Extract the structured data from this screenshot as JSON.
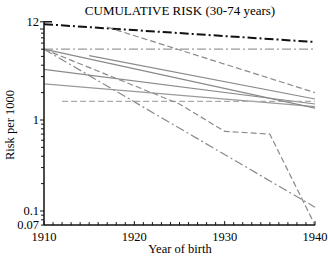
{
  "chart_data": {
    "type": "line",
    "title": "CUMULATIVE RISK (30-74 years)",
    "xlabel": "Year of birth",
    "ylabel": "Risk per 1000",
    "xlim": [
      1910,
      1940
    ],
    "ylim": [
      0.07,
      12
    ],
    "yscale": "log",
    "grid": false,
    "legend": "none",
    "x_ticks": [
      "1910",
      "1920",
      "1930",
      "1940"
    ],
    "y_ticks": [
      "12",
      "1",
      "0.1",
      "0.07"
    ],
    "series": [
      {
        "name": "series-1",
        "style": "dash-dot",
        "color": "#111111",
        "width": 2,
        "x": [
          1910,
          1940
        ],
        "values": [
          11.3,
          7.2
        ]
      },
      {
        "name": "series-2",
        "style": "dash-dot",
        "color": "#9a9a9a",
        "width": 1.2,
        "x": [
          1910,
          1940
        ],
        "values": [
          6.0,
          6.0
        ]
      },
      {
        "name": "series-3",
        "style": "dashed",
        "color": "#8a8a8a",
        "width": 1.2,
        "x": [
          1917,
          1940
        ],
        "values": [
          10.5,
          2.0
        ]
      },
      {
        "name": "series-4",
        "style": "solid",
        "color": "#8a8a8a",
        "width": 1.2,
        "x": [
          1915,
          1940
        ],
        "values": [
          5.1,
          1.7
        ]
      },
      {
        "name": "series-5",
        "style": "solid",
        "color": "#8a8a8a",
        "width": 1.2,
        "x": [
          1910,
          1940
        ],
        "values": [
          3.6,
          1.5
        ]
      },
      {
        "name": "series-6",
        "style": "solid",
        "color": "#9a9a9a",
        "width": 1.2,
        "x": [
          1910,
          1940
        ],
        "values": [
          2.5,
          1.4
        ]
      },
      {
        "name": "series-7",
        "style": "dashed",
        "color": "#aaaaaa",
        "width": 1.2,
        "x": [
          1912,
          1940
        ],
        "values": [
          1.6,
          1.6
        ]
      },
      {
        "name": "series-8",
        "style": "solid",
        "color": "#8a8a8a",
        "width": 1.2,
        "x": [
          1910,
          1940
        ],
        "values": [
          6.0,
          1.35
        ]
      },
      {
        "name": "series-9",
        "style": "dashed",
        "color": "#8a8a8a",
        "width": 1.2,
        "x": [
          1910,
          1925,
          1930,
          1935,
          1940
        ],
        "values": [
          6.0,
          1.5,
          0.75,
          0.7,
          0.07
        ]
      },
      {
        "name": "series-10",
        "style": "dash-dot",
        "color": "#8a8a8a",
        "width": 1.2,
        "x": [
          1910,
          1940
        ],
        "values": [
          6.0,
          0.11
        ]
      }
    ]
  }
}
